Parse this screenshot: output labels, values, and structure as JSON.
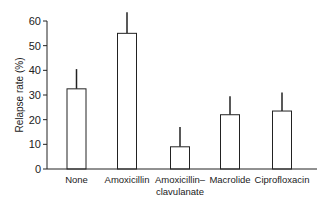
{
  "chart_data": {
    "type": "bar",
    "title": "",
    "xlabel": "",
    "ylabel": "Relapse rate (%)",
    "ylim": [
      0,
      60
    ],
    "yticks": [
      0,
      10,
      20,
      30,
      40,
      50,
      60
    ],
    "grid": false,
    "legend": null,
    "categories": [
      "None",
      "Amoxicillin",
      "Amoxicillin–clavulanate",
      "Macrolide",
      "Ciprofloxacin"
    ],
    "category_label_lines": [
      [
        "None"
      ],
      [
        "Amoxicillin"
      ],
      [
        "Amoxicillin–",
        "clavulanate"
      ],
      [
        "Macrolide"
      ],
      [
        "Ciprofloxacin"
      ]
    ],
    "values": [
      32.5,
      55,
      9,
      22,
      23.5
    ],
    "error_upper": [
      40.5,
      63.5,
      17,
      29.5,
      31
    ],
    "error_bars": "upper only",
    "colors": {
      "bar_fill": "#ffffff",
      "bar_stroke": "#222222",
      "axis": "#222222"
    }
  }
}
